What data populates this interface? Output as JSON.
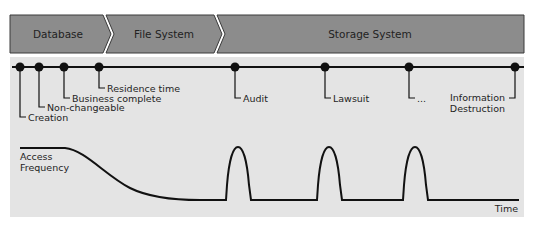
{
  "phases": [
    {
      "label": "Database"
    },
    {
      "label": "File System"
    },
    {
      "label": "Storage System"
    }
  ],
  "timeline_events": [
    {
      "label": "Creation"
    },
    {
      "label": "Non-changeable"
    },
    {
      "label": "Business complete"
    },
    {
      "label": "Residence time"
    },
    {
      "label": "Audit"
    },
    {
      "label": "Lawsuit"
    },
    {
      "label": "..."
    },
    {
      "label_line1": "Information",
      "label_line2": "Destruction"
    }
  ],
  "curve": {
    "ylabel_line1": "Access",
    "ylabel_line2": "Frequency",
    "xlabel": "Time"
  },
  "colors": {
    "phase_fill": "#8c8c8c",
    "panel_fill": "#e4e4e4",
    "line": "#111111"
  }
}
